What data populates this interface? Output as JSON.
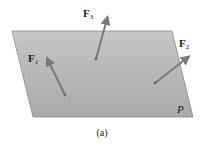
{
  "figure": {
    "caption": "(a)",
    "plane": {
      "label": "P",
      "fill_top": "#c4c4c4",
      "fill_bottom": "#a8a8a8",
      "edge": "#8a8a8a",
      "corners": [
        [
          12,
          31
        ],
        [
          172,
          31
        ],
        [
          193,
          117
        ],
        [
          33,
          117
        ]
      ]
    },
    "vector_color": "#7a7a7a",
    "forces": [
      {
        "name": "F",
        "sub": "1",
        "tail": [
          65,
          95
        ],
        "head": [
          46,
          56
        ],
        "label_pos": [
          28,
          62
        ]
      },
      {
        "name": "F",
        "sub": "3",
        "tail": [
          96,
          59
        ],
        "head": [
          108,
          15
        ],
        "label_pos": [
          83,
          17
        ]
      },
      {
        "name": "F",
        "sub": "2",
        "tail": [
          155,
          83
        ],
        "head": [
          191,
          55
        ],
        "label_pos": [
          179,
          47
        ]
      }
    ],
    "plane_label_pos": [
      177,
      113
    ],
    "caption_pos": [
      102,
      136
    ]
  }
}
